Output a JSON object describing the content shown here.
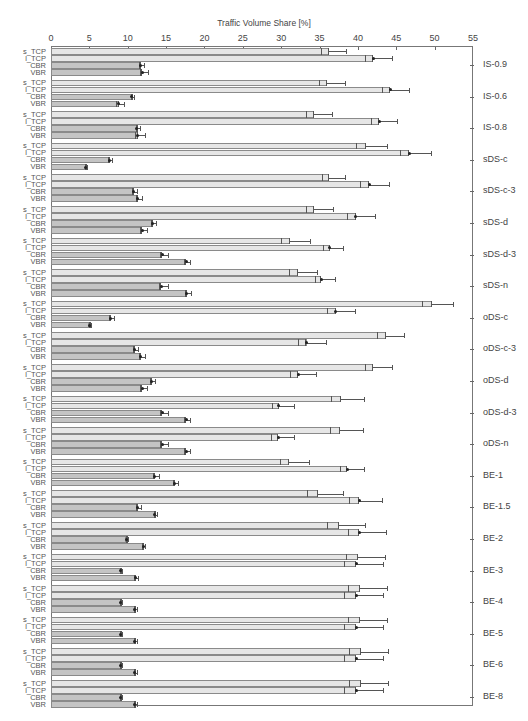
{
  "chart_data": {
    "type": "bar",
    "orientation": "horizontal",
    "title": "Traffic Volume Share [%]",
    "xlabel": "Traffic Volume Share [%]",
    "ylabel": "",
    "xlim": [
      0,
      55
    ],
    "x_ticks": [
      0,
      5,
      10,
      15,
      20,
      25,
      30,
      35,
      40,
      45,
      50,
      55
    ],
    "grid": false,
    "legend": null,
    "bar_labels": [
      "s_TCP",
      "l_TCP",
      "CBR",
      "VBR"
    ],
    "colors": {
      "s_TCP": "#e6e6e6",
      "l_TCP": "#e6e6e6",
      "CBR": "#c4c4c4",
      "VBR": "#c4c4c4",
      "border": "#8a8a8a",
      "error": "#555555"
    },
    "categories": [
      "IS-0.9",
      "IS-0.6",
      "IS-0.8",
      "sDS-c",
      "sDS-c-3",
      "sDS-d",
      "sDS-d-3",
      "sDS-n",
      "oDS-c",
      "oDS-c-3",
      "oDS-d",
      "oDS-d-3",
      "oDS-n",
      "BE-1",
      "BE-1.5",
      "BE-2",
      "BE-3",
      "BE-4",
      "BE-5",
      "BE-6",
      "BE-8"
    ],
    "series": [
      {
        "name": "s_TCP",
        "values": [
          36.2,
          36.0,
          34.3,
          41.0,
          36.2,
          34.3,
          31.2,
          32.2,
          49.6,
          43.6,
          42.0,
          37.8,
          37.7,
          31.0,
          34.8,
          37.5,
          40.0,
          40.3,
          40.3,
          40.4,
          40.4
        ],
        "error": [
          2.3,
          2.3,
          2.3,
          2.8,
          2.1,
          2.4,
          2.6,
          2.5,
          2.8,
          2.4,
          2.5,
          3.0,
          3.0,
          2.6,
          3.2,
          3.4,
          3.5,
          3.5,
          3.5,
          3.5,
          3.5
        ]
      },
      {
        "name": "l_TCP",
        "values": [
          42.0,
          44.2,
          42.8,
          46.7,
          41.5,
          39.7,
          36.3,
          35.2,
          37.1,
          33.3,
          32.2,
          29.7,
          29.6,
          38.6,
          40.2,
          40.2,
          39.8,
          39.8,
          39.8,
          39.8,
          39.8
        ],
        "error": [
          2.4,
          2.4,
          2.3,
          2.8,
          2.6,
          2.5,
          1.8,
          1.8,
          2.5,
          2.5,
          2.4,
          2.0,
          2.1,
          2.2,
          2.9,
          3.4,
          3.5,
          3.5,
          3.5,
          3.5,
          3.5
        ]
      },
      {
        "name": "CBR",
        "values": [
          11.7,
          10.5,
          11.2,
          7.6,
          10.8,
          13.2,
          14.5,
          14.4,
          7.8,
          10.9,
          13.1,
          14.5,
          14.5,
          13.5,
          11.3,
          9.8,
          9.1,
          9.1,
          9.1,
          9.1,
          9.1
        ],
        "error": [
          0.4,
          0.3,
          0.4,
          0.4,
          0.4,
          0.5,
          0.7,
          0.8,
          0.4,
          0.4,
          0.5,
          0.7,
          0.7,
          0.6,
          0.4,
          0.2,
          0.1,
          0.1,
          0.1,
          0.1,
          0.1
        ]
      },
      {
        "name": "VBR",
        "values": [
          11.9,
          8.8,
          11.3,
          4.5,
          11.3,
          11.9,
          17.6,
          17.7,
          5.0,
          11.7,
          11.9,
          17.6,
          17.6,
          16.1,
          13.5,
          12.0,
          11.0,
          10.9,
          10.9,
          10.9,
          10.9
        ],
        "error": [
          0.7,
          0.7,
          0.9,
          0.2,
          0.6,
          0.6,
          0.5,
          0.5,
          0.2,
          0.6,
          0.6,
          0.5,
          0.5,
          0.4,
          0.3,
          0.3,
          0.3,
          0.3,
          0.3,
          0.3,
          0.3
        ]
      }
    ]
  }
}
